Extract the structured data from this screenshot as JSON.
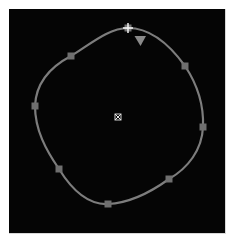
{
  "canvas": {
    "background": "#050505",
    "curve_color": "#7d7d7d",
    "handle_color": "#6f6f6f",
    "anchor_color": "#e6e6e6",
    "center_color": "#d0d0d0",
    "marker_color": "#8a8a8a"
  },
  "shape": {
    "type": "closed-bezier-path",
    "start_anchor": {
      "x": 128,
      "y": 28
    },
    "direction_marker": {
      "x": 140,
      "y": 41
    },
    "center_pivot": {
      "x": 118,
      "y": 117
    },
    "control_points": [
      {
        "x": 71,
        "y": 56
      },
      {
        "x": 185,
        "y": 66
      },
      {
        "x": 35,
        "y": 106
      },
      {
        "x": 203,
        "y": 127
      },
      {
        "x": 59,
        "y": 169
      },
      {
        "x": 169,
        "y": 179
      },
      {
        "x": 108,
        "y": 204
      }
    ]
  }
}
